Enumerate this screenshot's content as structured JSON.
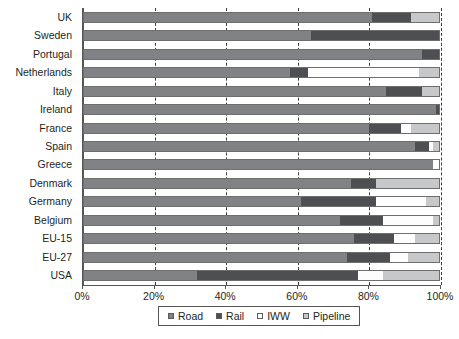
{
  "chart_data": {
    "type": "bar",
    "orientation": "horizontal",
    "stacked": true,
    "stack_mode": "percent",
    "title": "",
    "subtitle": "",
    "xlabel": "",
    "ylabel": "",
    "xlim": [
      0,
      100
    ],
    "grid": true,
    "grid_axis": "x",
    "grid_style": "dashed",
    "legend_position": "bottom",
    "xticks": [
      0,
      20,
      40,
      60,
      80,
      100
    ],
    "xticklabels": [
      "0%",
      "20%",
      "40%",
      "60%",
      "80%",
      "100%"
    ],
    "categories": [
      "UK",
      "Sweden",
      "Portugal",
      "Netherlands",
      "Italy",
      "Ireland",
      "France",
      "Spain",
      "Greece",
      "Denmark",
      "Germany",
      "Belgium",
      "EU-15",
      "EU-27",
      "USA"
    ],
    "series": [
      {
        "name": "Road",
        "color": "#808285",
        "values": [
          81,
          64,
          95,
          58,
          85,
          99,
          80,
          93,
          98,
          75,
          61,
          72,
          76,
          74,
          32
        ]
      },
      {
        "name": "Rail",
        "color": "#4d4f53",
        "values": [
          11,
          36,
          5,
          5,
          10,
          1,
          9,
          4,
          0,
          7,
          21,
          12,
          11,
          12,
          45
        ]
      },
      {
        "name": "IWW",
        "color": "#ffffff",
        "values": [
          0,
          0,
          0,
          31,
          0,
          0,
          3,
          1,
          2,
          0,
          14,
          14,
          6,
          5,
          7
        ]
      },
      {
        "name": "Pipeline",
        "color": "#c6c8ca",
        "values": [
          8,
          0,
          0,
          6,
          5,
          0,
          8,
          2,
          0,
          18,
          4,
          2,
          7,
          9,
          16
        ]
      }
    ]
  },
  "legend": {
    "items": [
      {
        "label": "Road",
        "swatch": "road"
      },
      {
        "label": "Rail",
        "swatch": "rail"
      },
      {
        "label": "IWW",
        "swatch": "iww"
      },
      {
        "label": "Pipeline",
        "swatch": "pipeline"
      }
    ]
  }
}
